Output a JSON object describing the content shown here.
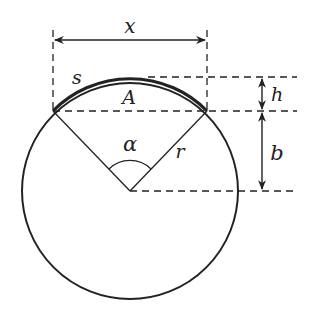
{
  "diagram": {
    "labels": {
      "chord_width": "x",
      "arc_length": "s",
      "segment_area": "A",
      "central_angle": "α",
      "radius": "r",
      "segment_height": "h",
      "center_to_chord": "b"
    },
    "geometry": {
      "center": [
        130,
        191
      ],
      "radius": 108,
      "chord_y": 111,
      "chord_left_x": 53,
      "chord_right_x": 207,
      "top_y": 77,
      "dimension_x_line_y": 40,
      "dimension_hb_x": 262
    },
    "colors": {
      "stroke": "#222222",
      "background": "#ffffff"
    }
  }
}
